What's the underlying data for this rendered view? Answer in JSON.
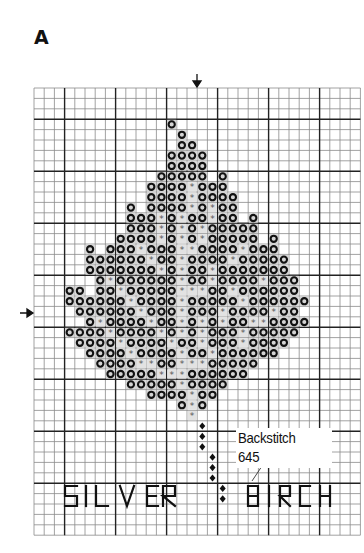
{
  "panel": {
    "label": "A"
  },
  "chart_data": {
    "type": "cross-stitch-pattern",
    "grid": {
      "columns": 32,
      "rows": 43,
      "major_every": 5,
      "major_col_offset": 3,
      "major_row_offset": 3
    },
    "center_markers": {
      "top_arrow_col": 16,
      "left_arrow_row": 21
    },
    "legend": [
      {
        "symbol": "o",
        "name": "dark-ring-stitch",
        "meaning": "full cross stitch (dark)"
      },
      {
        "symbol": "*",
        "name": "asterisk-stitch",
        "meaning": "full cross stitch (light)"
      },
      {
        "symbol": "diamond",
        "name": "backstitch-point",
        "meaning": "Backstitch 645"
      }
    ],
    "rows": [
      {
        "row": 3,
        "o": [
          13
        ],
        "star": []
      },
      {
        "row": 4,
        "o": [
          14
        ],
        "star": []
      },
      {
        "row": 5,
        "o": [
          14,
          15
        ],
        "star": []
      },
      {
        "row": 6,
        "o": [
          13,
          14,
          15,
          16
        ],
        "star": []
      },
      {
        "row": 7,
        "o": [
          13,
          14,
          15,
          16
        ],
        "star": []
      },
      {
        "row": 8,
        "o": [
          12,
          13,
          14,
          15,
          16,
          18
        ],
        "star": []
      },
      {
        "row": 9,
        "o": [
          11,
          12,
          13,
          14,
          16,
          17,
          18
        ],
        "star": [
          15
        ]
      },
      {
        "row": 10,
        "o": [
          11,
          12,
          13,
          14,
          16,
          17,
          18,
          19
        ],
        "star": [
          15
        ]
      },
      {
        "row": 11,
        "o": [
          9,
          11,
          12,
          13,
          14,
          16,
          18,
          19
        ],
        "star": [
          15,
          17
        ]
      },
      {
        "row": 12,
        "o": [
          9,
          10,
          11,
          13,
          15,
          16,
          18,
          19,
          21
        ],
        "star": [
          12,
          14,
          17
        ]
      },
      {
        "row": 13,
        "o": [
          9,
          10,
          11,
          13,
          15,
          17,
          18,
          19,
          20,
          21
        ],
        "star": [
          12,
          14,
          16
        ]
      },
      {
        "row": 14,
        "o": [
          8,
          9,
          10,
          11,
          13,
          15,
          17,
          18,
          19,
          20,
          21,
          23
        ],
        "star": [
          12,
          14,
          16
        ]
      },
      {
        "row": 15,
        "o": [
          5,
          7,
          8,
          9,
          11,
          12,
          13,
          16,
          17,
          18,
          19,
          21,
          22,
          23
        ],
        "star": [
          10,
          14,
          15,
          20
        ]
      },
      {
        "row": 16,
        "o": [
          5,
          6,
          7,
          8,
          9,
          10,
          12,
          13,
          15,
          16,
          17,
          18,
          20,
          21,
          22,
          23,
          24
        ],
        "star": [
          11,
          14,
          19
        ]
      },
      {
        "row": 17,
        "o": [
          5,
          6,
          7,
          8,
          9,
          10,
          11,
          13,
          15,
          16,
          18,
          19,
          20,
          21,
          22,
          23,
          24
        ],
        "star": [
          12,
          14,
          17
        ]
      },
      {
        "row": 18,
        "o": [
          6,
          8,
          9,
          10,
          11,
          12,
          13,
          15,
          16,
          18,
          19,
          20,
          21,
          23,
          24,
          25
        ],
        "star": [
          7,
          14,
          17,
          22
        ]
      },
      {
        "row": 19,
        "o": [
          3,
          4,
          6,
          7,
          9,
          10,
          11,
          12,
          13,
          17,
          18,
          20,
          21,
          22,
          23,
          24,
          25
        ],
        "star": [
          8,
          14,
          15,
          16,
          19
        ]
      },
      {
        "row": 20,
        "o": [
          3,
          4,
          5,
          6,
          7,
          8,
          10,
          11,
          12,
          13,
          15,
          16,
          17,
          18,
          19,
          21,
          22,
          23,
          24,
          25,
          26
        ],
        "star": [
          9,
          14,
          20
        ]
      },
      {
        "row": 21,
        "o": [
          4,
          5,
          6,
          7,
          8,
          9,
          11,
          12,
          13,
          15,
          16,
          17,
          19,
          20,
          21,
          22,
          24,
          25
        ],
        "star": [
          10,
          14,
          18,
          23
        ]
      },
      {
        "row": 22,
        "o": [
          5,
          7,
          8,
          9,
          10,
          12,
          13,
          15,
          17,
          19,
          20,
          23,
          24,
          25,
          26
        ],
        "star": [
          6,
          11,
          14,
          16,
          18,
          21,
          22
        ]
      },
      {
        "row": 23,
        "o": [
          3,
          4,
          5,
          6,
          8,
          9,
          10,
          11,
          13,
          15,
          17,
          18,
          19,
          21,
          22,
          23,
          24,
          25
        ],
        "star": [
          7,
          12,
          14,
          16,
          20
        ]
      },
      {
        "row": 24,
        "o": [
          4,
          5,
          6,
          7,
          9,
          10,
          11,
          12,
          14,
          15,
          17,
          18,
          19,
          21,
          22,
          23,
          24
        ],
        "star": [
          8,
          13,
          16,
          20
        ]
      },
      {
        "row": 25,
        "o": [
          5,
          6,
          7,
          8,
          10,
          11,
          12,
          13,
          15,
          16,
          18,
          19,
          20,
          21,
          22,
          23
        ],
        "star": [
          9,
          14,
          17
        ]
      },
      {
        "row": 26,
        "o": [
          6,
          7,
          8,
          9,
          12,
          13,
          17,
          18,
          19,
          20,
          21
        ],
        "star": [
          10,
          11,
          14,
          15,
          16
        ]
      },
      {
        "row": 27,
        "o": [
          7,
          8,
          9,
          10,
          11,
          15,
          16,
          17,
          18,
          19,
          20
        ],
        "star": [
          12,
          13,
          14
        ]
      },
      {
        "row": 28,
        "o": [
          9,
          10,
          11,
          12,
          13,
          15,
          16,
          17,
          18
        ],
        "star": [
          14
        ]
      },
      {
        "row": 29,
        "o": [
          11,
          12,
          13,
          14,
          16,
          17
        ],
        "star": [
          15
        ]
      },
      {
        "row": 30,
        "o": [
          14,
          16
        ],
        "star": [
          15
        ]
      },
      {
        "row": 31,
        "o": [],
        "star": [
          15
        ]
      }
    ],
    "backstitch_points": [
      {
        "col": 16,
        "row": 32
      },
      {
        "col": 16,
        "row": 33
      },
      {
        "col": 16,
        "row": 34
      },
      {
        "col": 17,
        "row": 35
      },
      {
        "col": 17,
        "row": 36
      },
      {
        "col": 17,
        "row": 37
      },
      {
        "col": 18,
        "row": 38
      },
      {
        "col": 18,
        "row": 39
      }
    ],
    "annotation": {
      "line1": "Backstitch",
      "line2": "645"
    },
    "caption_words": [
      "SILVER",
      "BIRCH"
    ]
  },
  "colors": {
    "ink": "#111111",
    "grid_minor": "#8a8a8a",
    "grid_major": "#222222",
    "star": "#555555",
    "background": "#ffffff"
  }
}
